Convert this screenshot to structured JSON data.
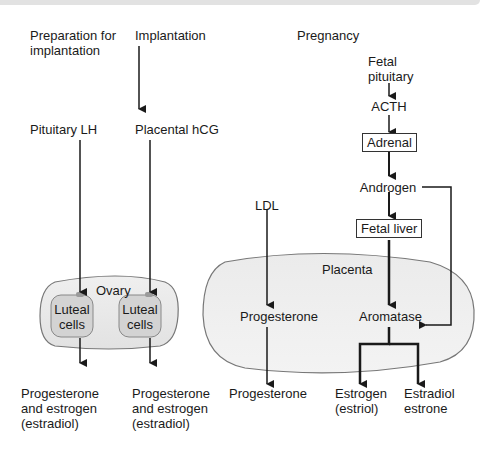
{
  "columns": {
    "preparation": {
      "header": "Preparation for\nimplantation",
      "hormone": "Pituitary LH",
      "output": "Progesterone\nand estrogen\n(estradiol)"
    },
    "implantation": {
      "header": "Implantation",
      "hormone": "Placental hCG",
      "output": "Progesterone\nand estrogen\n(estradiol)"
    },
    "pregnancy": {
      "header": "Pregnancy"
    }
  },
  "ovary": {
    "label": "Ovary",
    "cell_left": "Luteal\ncells",
    "cell_right": "Luteal\ncells"
  },
  "fetal_pathway": {
    "fetal_pituitary": "Fetal\npituitary",
    "acth": "ACTH",
    "adrenal": "Adrenal",
    "androgen": "Androgen",
    "fetal_liver": "Fetal liver"
  },
  "placenta": {
    "label": "Placenta",
    "ldl": "LDL",
    "progesterone_inner": "Progesterone",
    "aromatase": "Aromatase",
    "progesterone_output": "Progesterone",
    "estrogen_output": "Estrogen\n(estriol)",
    "estradiol_output": "Estradiol\nestrone"
  },
  "colors": {
    "ovary_fill": "#e9e9e9",
    "luteal_fill": "#d2d2d2",
    "placenta_fill": "#e8e8e8",
    "outline": "#777777",
    "arrow": "#1a1a1a"
  }
}
